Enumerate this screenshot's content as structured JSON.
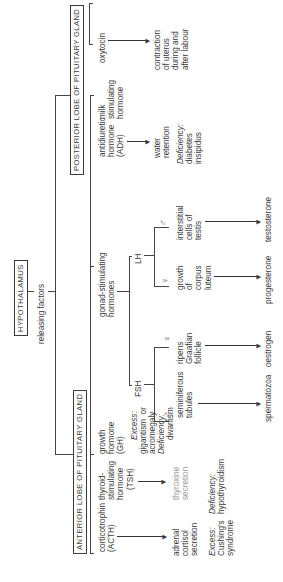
{
  "title": "HYPOTHALAMUS",
  "hypothalamus": {
    "label": "HYPOTHALAMUS",
    "releasing": "releasing factors"
  },
  "anterior": {
    "label": "ANTERIOR LOBE OF PITUITARY GLAND",
    "acth": {
      "hormone": "corticotrophin\n(ACTH)",
      "effect": "adrenal\ncortisol\nsecretion",
      "excess_label": "Excess:",
      "excess": "Cushing's\nsyndrome"
    },
    "tsh": {
      "hormone": "thyroid-\nstimulating\nhormone",
      "abbr": "(TSH)",
      "effect": "thyroxine\nsecretion",
      "deficiency_label": "Deficiency:",
      "deficiency": "hypothyroidism"
    },
    "gh": {
      "hormone": "growth\nhormone\n(GH)",
      "excess_label": "Excess:",
      "excess": "gigantism  or\nacromegaly",
      "deficiency_label": "Deficiency:",
      "deficiency": "dwarfism"
    },
    "gonad": {
      "hormone": "gonad-stimulating\nhormones",
      "fsh": {
        "label": "FSH",
        "male_symbol": "♂",
        "male_target": "seminiferous\ntubules",
        "male_product": "spermatozoa",
        "female_symbol": "♀",
        "female_target": "ripens\nGraafian\nfollicle",
        "female_product": "oestrogen"
      },
      "lh": {
        "label": "LH",
        "female_symbol": "♀",
        "female_target": "growth\nof\ncorpus\nluteum",
        "female_product": "progesterone",
        "male_symbol": "♂",
        "male_target": "interstitial\ncells of\ntestis",
        "male_product": "testosterone"
      }
    },
    "milk": {
      "hormone": "milk\nstimulating\nhormone"
    }
  },
  "posterior": {
    "label": "POSTERIOR LOBE OF PITUITARY GLAND",
    "adh": {
      "hormone": "antidiuretic\nhormone\n(ADH)",
      "effect": "water\nretention",
      "deficiency_label": "Deficiency:",
      "deficiency": "diabetes\ninsipidus"
    },
    "oxytocin": {
      "hormone": "oxytocin",
      "effect": "contraction\nof uterus\nduring and\nafter labour"
    }
  },
  "colors": {
    "ink": "#3a3a3a",
    "faint": "#9a9a9a",
    "background": "#ffffff"
  }
}
